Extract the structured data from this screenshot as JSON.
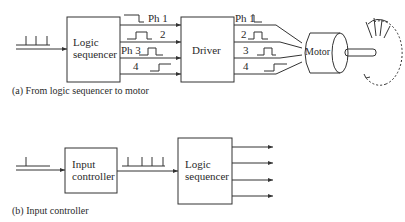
{
  "diagram_a": {
    "caption": "(a) From logic sequencer to motor",
    "blocks": {
      "logic_sequencer": {
        "line1": "Logic",
        "line2": "sequencer"
      },
      "driver": "Driver",
      "motor": "Motor"
    },
    "phases_in": [
      "Ph 1",
      "2",
      "Ph 3",
      "4"
    ],
    "phases_out": [
      "Ph 1",
      "2",
      "3",
      "4"
    ]
  },
  "diagram_b": {
    "caption": "(b) Input controller",
    "blocks": {
      "input_controller": {
        "line1": "Input",
        "line2": "controller"
      },
      "logic_sequencer": {
        "line1": "Logic",
        "line2": "sequencer"
      }
    },
    "outputs_count": 4
  },
  "colors": {
    "stroke": "#333333",
    "background": "#ffffff"
  }
}
